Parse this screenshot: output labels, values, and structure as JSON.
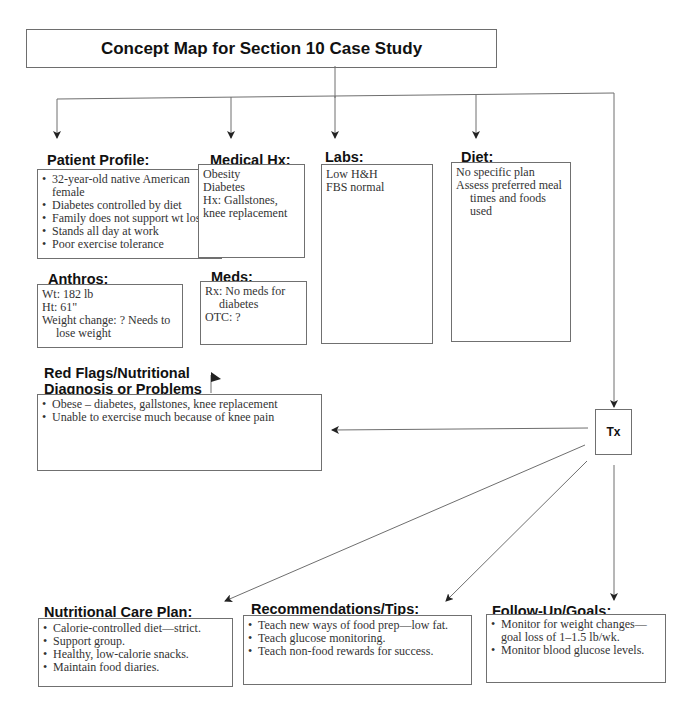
{
  "title": "Concept Map for Section 10 Case Study",
  "patient_profile": {
    "heading": "Patient Profile:",
    "items": [
      "32-year-old native American female",
      "Diabetes controlled by diet",
      "Family does not support wt loss",
      "Stands all day at work",
      "Poor exercise tolerance"
    ]
  },
  "medical_hx": {
    "heading": "Medical Hx:",
    "lines": [
      "Obesity",
      "Diabetes",
      "Hx: Gallstones, knee replacement"
    ]
  },
  "labs": {
    "heading": "Labs:",
    "lines": [
      "Low H&H",
      "FBS normal"
    ]
  },
  "diet": {
    "heading": "Diet:",
    "lines": [
      "No specific plan",
      "Assess preferred meal",
      "times and foods used"
    ]
  },
  "anthros": {
    "heading": "Anthros:",
    "lines": [
      "Wt: 182 lb",
      "Ht: 61\"",
      "Weight change: ?  Needs to",
      "lose weight"
    ]
  },
  "meds": {
    "heading": "Meds:",
    "lines": [
      "Rx: No meds for",
      "diabetes",
      "OTC: ?"
    ]
  },
  "red_flags": {
    "heading_line1": "Red Flags/Nutritional",
    "heading_line2": "Diagnosis or Problems",
    "items": [
      "Obese – diabetes, gallstones, knee replacement",
      "Unable to exercise much because of knee pain"
    ]
  },
  "tx": {
    "label": "Tx"
  },
  "nutritional_care_plan": {
    "heading": "Nutritional Care Plan:",
    "items": [
      "Calorie-controlled diet—strict.",
      "Support group.",
      "Healthy, low-calorie snacks.",
      "Maintain food diaries."
    ]
  },
  "recommendations": {
    "heading": "Recommendations/Tips:",
    "items": [
      "Teach new ways of food prep—low fat.",
      "Teach glucose monitoring.",
      "Teach non-food rewards for success."
    ]
  },
  "follow_up": {
    "heading": "Follow-Up/Goals:",
    "items": [
      "Monitor for weight changes—goal loss of 1–1.5 lb/wk.",
      "Monitor blood glucose levels."
    ]
  },
  "colors": {
    "line": "#6e6e6e",
    "text": "#333333",
    "heading": "#111111"
  }
}
